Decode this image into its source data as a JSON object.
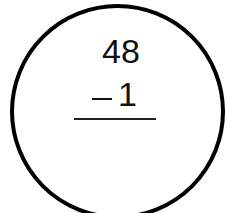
{
  "problem": {
    "minuend": "48",
    "operator": "−",
    "subtrahend": "1",
    "answer": ""
  },
  "colors": {
    "circle": "#000000",
    "text": "#111111",
    "background": "#ffffff"
  }
}
